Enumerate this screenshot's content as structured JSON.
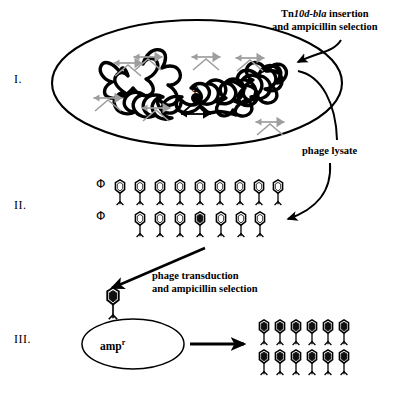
{
  "figure": {
    "stages": [
      {
        "numeral": "I.",
        "name": "donor-cell-transposon-insertion"
      },
      {
        "numeral": "II.",
        "name": "phage-lysate-particles"
      },
      {
        "numeral": "III.",
        "name": "recipient-cell-transduction"
      }
    ]
  },
  "labels": {
    "roman_1": "I.",
    "roman_2": "II.",
    "roman_3": "III.",
    "insertion_line1_prefix": "Tn",
    "insertion_line1_italic": "10d-bla",
    "insertion_line1_suffix": " insertion",
    "insertion_line2": "and ampicillin selection",
    "phage_lysate": "phage lysate",
    "transduction_line1": "phage transduction",
    "transduction_line2": "and ampicillin selection",
    "amp_resistance": "amp",
    "amp_resistance_sup": "r",
    "phi_symbol_row1": "Φ",
    "phi_symbol_row2": "Φ",
    "phi_symbol_chromosome": "Φ",
    "bottom_cut_text": " "
  },
  "colors": {
    "ink": "#000000",
    "transposon_marker": "#a6a6a6",
    "transposon_marker_dark": "#8c8c8c",
    "phage_head_fill_empty": "#ffffff",
    "phage_head_fill_loaded": "#101010",
    "cell_outline": "#000000",
    "background": "#ffffff"
  },
  "stage1": {
    "name": "donor-bacterium",
    "cell_shape": "ellipse",
    "chromosome": "wavy-closed-loop",
    "transposon_marker_count": 7,
    "prophage_marker_count": 1,
    "prophage_label": "Φ"
  },
  "stage2": {
    "name": "phage-lysate-array",
    "row1_phage_count": 9,
    "row2_phage_count": 7,
    "row2_loaded_index": 3,
    "loaded_phage_count": 1,
    "empty_phage_count": 15
  },
  "stage3": {
    "name": "transductant-colony",
    "infecting_phage_count": 1,
    "recipient_cell_shape": "ellipse",
    "recipient_label": "amp",
    "progeny_rows": 2,
    "progeny_per_row": 6,
    "progeny_total": 12,
    "progeny_all_loaded": true
  },
  "arrows": {
    "insertion_arrow": "curved-arrow-into-cell-from-top-right",
    "lysate_arrow": "curved-arrow-down-left-to-stage2",
    "transduction_arrow": "straight-arrow-down-left-to-stage3",
    "progeny_arrow": "straight-arrow-right"
  }
}
